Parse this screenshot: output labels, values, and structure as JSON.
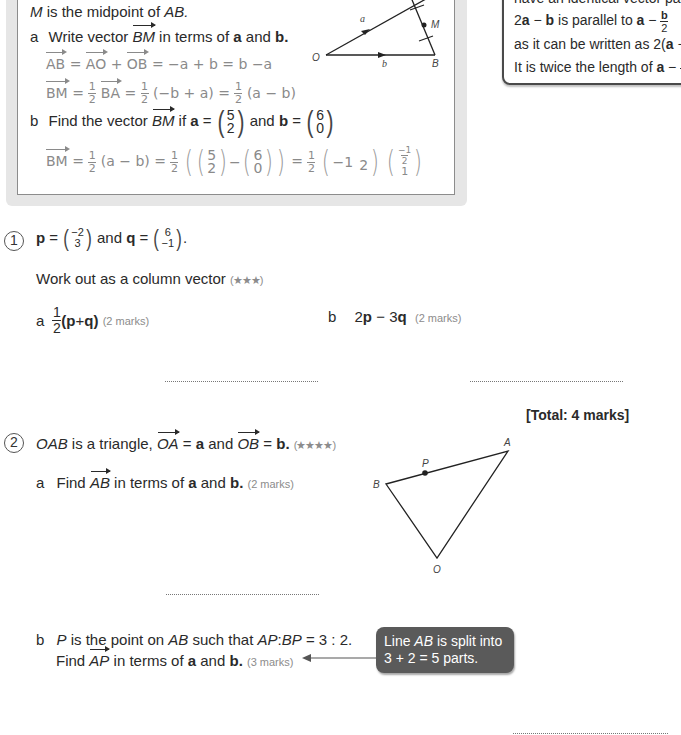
{
  "worked_example": {
    "intro": "is the midpoint of",
    "intro_m": "M",
    "intro_ab": "AB.",
    "part_a": {
      "label": "a",
      "text_1": "Write vector",
      "vector": "BM",
      "text_2": "in terms of",
      "a": "a",
      "and": "and",
      "b": "b."
    },
    "working_1": {
      "ab": "AB",
      "ao": "AO",
      "ob": "OB",
      "rest": "= −a + b = b −a"
    },
    "working_2": {
      "bm": "BM",
      "ba": "BA",
      "mid": "(−b + a) =",
      "end": "(a − b)"
    },
    "part_b": {
      "label": "b",
      "text_1": "Find the vector",
      "vector": "BM",
      "text_2": "if",
      "a": "a",
      "a_vec": [
        "5",
        "2"
      ],
      "and": "and",
      "b": "b",
      "b_vec": [
        "6",
        "0"
      ]
    },
    "working_3": {
      "bm": "BM",
      "step1": "(a − b) =",
      "v1": [
        "5",
        "2"
      ],
      "v2": [
        "6",
        "0"
      ],
      "v3": [
        "−1",
        "2"
      ],
      "v4_top": "−1",
      "v4_top_den": "2",
      "v4_bottom": "1"
    },
    "diagram": {
      "label_o": "O",
      "label_b": "B",
      "label_m": "M",
      "label_a_vec": "a",
      "label_b_vec": "b"
    }
  },
  "tip_box": {
    "line_1": "have an identical vector part",
    "line_2_pre": "2",
    "line_2_a": "a",
    "line_2_mid": " − ",
    "line_2_b": "b",
    "line_2_text": " is parallel to ",
    "line_2_a2": "a",
    "line_2_minus": " − ",
    "line_2_frac_num": "b",
    "line_2_frac_den": "2",
    "line_3": "as it can be written as 2(",
    "line_3_a": "a",
    "line_3_end": " −",
    "line_4": "It is twice the length of ",
    "line_4_a": "a",
    "line_4_minus": " − ",
    "line_4_frac_num": "b",
    "line_4_frac_den": "2"
  },
  "question_1": {
    "number": "1",
    "p": "p",
    "eq": "=",
    "p_vec": [
      "−2",
      "3"
    ],
    "and": "and",
    "q": "q",
    "q_vec": [
      "6",
      "−1"
    ],
    "period": ".",
    "instruction": "Work out as a column vector",
    "stars": "(★★★)",
    "part_a": {
      "label": "a",
      "frac_num": "1",
      "frac_den": "2",
      "expr_open": "(",
      "p": "p",
      "plus": " + ",
      "q": "q",
      "expr_close": ")",
      "marks": "(2 marks)"
    },
    "part_b": {
      "label": "b",
      "two": "2",
      "p": "p",
      "minus": " − 3",
      "q": "q",
      "marks": "(2 marks)"
    },
    "total": "[Total: 4 marks]"
  },
  "question_2": {
    "number": "2",
    "text_oab": "OAB",
    "text_1": "is a triangle,",
    "oa": "OA",
    "eq_a": "=",
    "a": "a",
    "and": "and",
    "ob": "OB",
    "eq_b": "=",
    "b": "b.",
    "stars": "(★★★★)",
    "part_a": {
      "label": "a",
      "text_1": "Find",
      "vector": "AB",
      "text_2": "in terms of",
      "a": "a",
      "and": "and",
      "b": "b.",
      "marks": "(2 marks)"
    },
    "part_b": {
      "label": "b",
      "p": "P",
      "text_1": "is the point on",
      "ab": "AB",
      "text_2": "such that",
      "ratio_ap": "AP",
      "ratio_colon": ":",
      "ratio_bp": "BP",
      "ratio_value": "= 3 : 2.",
      "text_3": "Find",
      "vector": "AP",
      "text_4": "in terms of",
      "a": "a",
      "and": "and",
      "b": "b.",
      "marks": "(3 marks)"
    },
    "callout": {
      "line_1_pre": "Line ",
      "line_1_ab": "AB",
      "line_1_post": " is split into",
      "line_2": "3 + 2 = 5 parts."
    },
    "diagram": {
      "label_a": "A",
      "label_b": "B",
      "label_o": "O",
      "label_p": "P"
    }
  }
}
